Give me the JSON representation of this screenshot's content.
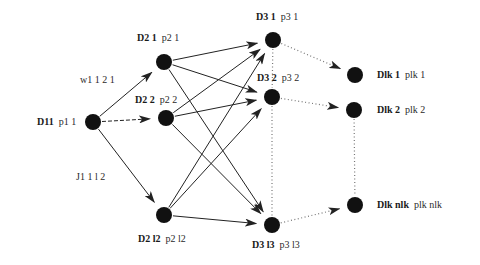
{
  "diagram": {
    "type": "multistage-graph",
    "colors": {
      "node": "#111111",
      "solid_edge": "#222222",
      "dotted_edge": "#777777",
      "background": "#ffffff"
    },
    "nodes": [
      {
        "id": "D11",
        "name": "D11",
        "prob": "p1 1",
        "x": 93,
        "y": 122,
        "label_x": 37,
        "label_y": 117
      },
      {
        "id": "D21",
        "name": "D2 1",
        "prob": "p2 1",
        "x": 164,
        "y": 62,
        "label_x": 137,
        "label_y": 33
      },
      {
        "id": "D22",
        "name": "D2 2",
        "prob": "p2 2",
        "x": 166,
        "y": 118,
        "label_x": 135,
        "label_y": 95
      },
      {
        "id": "D2l2",
        "name": "D2 l2",
        "prob": "p2 l2",
        "x": 164,
        "y": 215,
        "label_x": 138,
        "label_y": 234
      },
      {
        "id": "D31",
        "name": "D3 1",
        "prob": "p3 1",
        "x": 273,
        "y": 40,
        "label_x": 256,
        "label_y": 12
      },
      {
        "id": "D32",
        "name": "D3 2",
        "prob": "p3 2",
        "x": 272,
        "y": 97,
        "label_x": 257,
        "label_y": 73
      },
      {
        "id": "D3l3",
        "name": "D3 l3",
        "prob": "p3 l3",
        "x": 272,
        "y": 225,
        "label_x": 252,
        "label_y": 240
      },
      {
        "id": "Dlk1",
        "name": "Dlk 1",
        "prob": "plk 1",
        "x": 355,
        "y": 75,
        "label_x": 377,
        "label_y": 70
      },
      {
        "id": "Dlk2",
        "name": "Dlk 2",
        "prob": "plk 2",
        "x": 354,
        "y": 110,
        "label_x": 377,
        "label_y": 105
      },
      {
        "id": "Dlknlk",
        "name": "Dlk nlk",
        "prob": "plk nlk",
        "x": 355,
        "y": 205,
        "label_x": 377,
        "label_y": 200
      }
    ],
    "edge_labels": [
      {
        "text": "w1 1  2 1",
        "x": 80,
        "y": 75
      },
      {
        "text": "J1 1  l 2",
        "x": 76,
        "y": 172
      }
    ],
    "solid_edges": [
      {
        "from": "D11",
        "to": "D21"
      },
      {
        "from": "D11",
        "to": "D22",
        "style": "dashed"
      },
      {
        "from": "D11",
        "to": "D2l2"
      },
      {
        "from": "D21",
        "to": "D31"
      },
      {
        "from": "D21",
        "to": "D32"
      },
      {
        "from": "D21",
        "to": "D3l3"
      },
      {
        "from": "D22",
        "to": "D31"
      },
      {
        "from": "D22",
        "to": "D32"
      },
      {
        "from": "D22",
        "to": "D3l3"
      },
      {
        "from": "D2l2",
        "to": "D31"
      },
      {
        "from": "D2l2",
        "to": "D32"
      },
      {
        "from": "D2l2",
        "to": "D3l3"
      }
    ],
    "dotted_edges": [
      {
        "from": "D31",
        "to": "Dlk1",
        "arrow": true
      },
      {
        "from": "D32",
        "to": "Dlk2",
        "arrow": true
      },
      {
        "from": "D3l3",
        "to": "Dlknlk",
        "arrow": true
      },
      {
        "from": "D31",
        "to": "D32",
        "arrow": false
      },
      {
        "from": "D32",
        "to": "D3l3",
        "arrow": false
      },
      {
        "from": "Dlk2",
        "to": "Dlknlk",
        "arrow": false
      }
    ]
  }
}
